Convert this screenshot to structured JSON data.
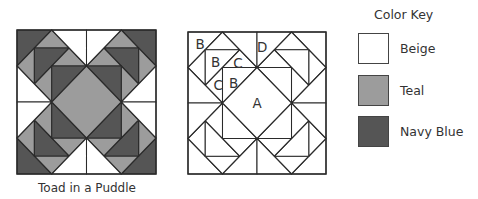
{
  "colors": {
    "beige": "#ffffff",
    "teal": "#9c9c9c",
    "navy": "#555555",
    "outline": "#2a2a2a"
  },
  "block": {
    "name": "Toad in a Puddle",
    "grid_size": 8,
    "caption": "Toad in a Puddle"
  },
  "pattern_labels": [
    {
      "text": "B",
      "x": 0.7,
      "y": 0.7
    },
    {
      "text": "D",
      "x": 4.3,
      "y": 0.85
    },
    {
      "text": "B",
      "x": 1.6,
      "y": 1.7
    },
    {
      "text": "C",
      "x": 2.9,
      "y": 1.75
    },
    {
      "text": "B",
      "x": 2.65,
      "y": 2.85
    },
    {
      "text": "C",
      "x": 1.75,
      "y": 3.0
    },
    {
      "text": "A",
      "x": 4.0,
      "y": 4.0
    }
  ],
  "color_key": {
    "title": "Color Key",
    "items": [
      {
        "label": "Beige",
        "color": "#ffffff"
      },
      {
        "label": "Teal",
        "color": "#9c9c9c"
      },
      {
        "label": "Navy Blue",
        "color": "#555555"
      }
    ]
  }
}
